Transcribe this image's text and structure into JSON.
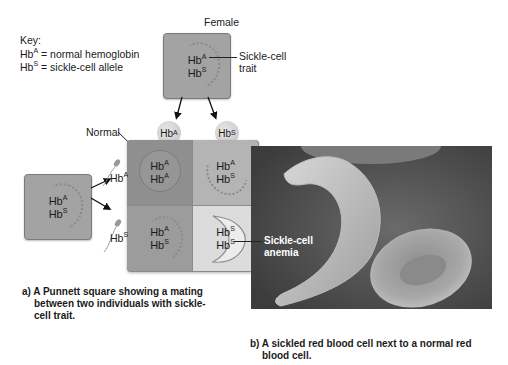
{
  "key": {
    "title": "Key:",
    "items": [
      {
        "base": "Hb",
        "sup": "A",
        "text": " = normal hemoglobin"
      },
      {
        "base": "Hb",
        "sup": "S",
        "text": " = sickle-cell allele"
      }
    ]
  },
  "female": {
    "label": "Female",
    "genotype": [
      {
        "base": "Hb",
        "sup": "A"
      },
      {
        "base": "Hb",
        "sup": "S"
      }
    ],
    "annotation": "Sickle-cell trait",
    "annotation_lines": [
      "Sickle-cell",
      "trait"
    ]
  },
  "male": {
    "label": "Male",
    "genotype": [
      {
        "base": "Hb",
        "sup": "A"
      },
      {
        "base": "Hb",
        "sup": "S"
      }
    ]
  },
  "gametes": {
    "female": [
      {
        "base": "Hb",
        "sup": "A"
      },
      {
        "base": "Hb",
        "sup": "S"
      }
    ],
    "male": [
      {
        "base": "Hb",
        "sup": "A"
      },
      {
        "base": "Hb",
        "sup": "S"
      }
    ]
  },
  "punnett": {
    "cells": [
      {
        "top": {
          "base": "Hb",
          "sup": "A"
        },
        "bottom": {
          "base": "Hb",
          "sup": "A"
        },
        "color": "#8f8f8f",
        "phenotype": "Normal"
      },
      {
        "top": {
          "base": "Hb",
          "sup": "A"
        },
        "bottom": {
          "base": "Hb",
          "sup": "S"
        },
        "color": "#b4b4b4",
        "phenotype": "Sickle-cell trait"
      },
      {
        "top": {
          "base": "Hb",
          "sup": "A"
        },
        "bottom": {
          "base": "Hb",
          "sup": "S"
        },
        "color": "#9c9c9c",
        "phenotype": "Sickle-cell trait"
      },
      {
        "top": {
          "base": "Hb",
          "sup": "S"
        },
        "bottom": {
          "base": "Hb",
          "sup": "S"
        },
        "color": "#dcdcdc",
        "phenotype": "Sickle-cell anemia"
      }
    ],
    "normal_label": "Normal",
    "anemia_label_lines": [
      "Sickle-cell",
      "anemia"
    ]
  },
  "captions": {
    "a_lines": [
      "a) A Punnett square showing a mating",
      "between two individuals with sickle-",
      "cell trait."
    ],
    "b_lines": [
      "b) A sickled red blood cell next to a normal red",
      "blood cell."
    ]
  },
  "colors": {
    "box_fill": "#a3a3a3",
    "photo_bg": "#5a5a5a",
    "cell_fill": "#c9c9c9"
  }
}
